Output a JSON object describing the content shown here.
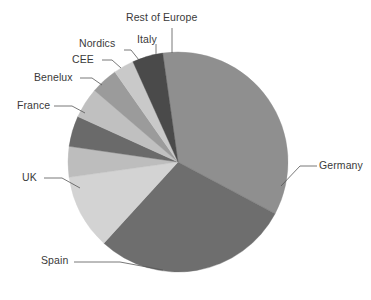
{
  "chart_data": {
    "type": "pie",
    "title": "",
    "subtitle": "",
    "xlabel": "",
    "ylabel": "",
    "grid": false,
    "legend_position": "none",
    "label_style": "leader-lines",
    "start_angle_deg": -8,
    "direction": "clockwise",
    "center": {
      "x": 178,
      "y": 162
    },
    "radius": 110,
    "categories": [
      "Germany",
      "Spain",
      "UK",
      "France",
      "Benelux",
      "CEE",
      "Nordics",
      "Italy",
      "Rest of Europe"
    ],
    "values": [
      35,
      29,
      11,
      4.5,
      4.5,
      4.5,
      4,
      3,
      4.5
    ],
    "colors": [
      "#8f8f8f",
      "#6e6e6e",
      "#d3d3d3",
      "#bdbdbd",
      "#6a6a6a",
      "#c0c0c0",
      "#9b9b9b",
      "#c9c9c9",
      "#4a4a4a"
    ],
    "series": [
      {
        "name": "Share of Europe",
        "values": [
          35,
          29,
          11,
          4.5,
          4.5,
          4.5,
          4,
          3,
          4.5
        ]
      }
    ]
  },
  "labels": {
    "germany": "Germany",
    "spain": "Spain",
    "uk": "UK",
    "france": "France",
    "benelux": "Benelux",
    "cee": "CEE",
    "nordics": "Nordics",
    "italy": "Italy",
    "rest_of_europe": "Rest of Europe"
  },
  "colors": {
    "background": "#ffffff",
    "text": "#3a3a3a",
    "leader_line": "#555555"
  }
}
